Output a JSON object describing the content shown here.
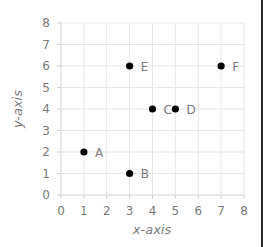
{
  "chart_data": {
    "type": "scatter",
    "title": "",
    "xlabel": "x-axis",
    "ylabel": "y-axis",
    "xlim": [
      0,
      8
    ],
    "ylim": [
      0,
      8
    ],
    "xticks": [
      "0",
      "1",
      "2",
      "3",
      "4",
      "5",
      "6",
      "7",
      "8"
    ],
    "yticks": [
      "0",
      "1",
      "2",
      "3",
      "4",
      "5",
      "6",
      "7",
      "8"
    ],
    "grid": true,
    "legend": "none",
    "points": [
      {
        "label": "A",
        "x": 1,
        "y": 2
      },
      {
        "label": "B",
        "x": 3,
        "y": 1
      },
      {
        "label": "C",
        "x": 4,
        "y": 4
      },
      {
        "label": "D",
        "x": 5,
        "y": 4
      },
      {
        "label": "E",
        "x": 3,
        "y": 6
      },
      {
        "label": "F",
        "x": 7,
        "y": 6
      }
    ],
    "colors": {
      "marker": "#000000",
      "grid": "#e6e6e6",
      "axis": "#d0d0d0",
      "text": "#7a7a7a"
    }
  }
}
